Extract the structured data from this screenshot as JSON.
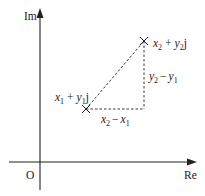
{
  "diagram": {
    "axes": {
      "y_label": "Im",
      "x_label": "Re",
      "origin_label": "O"
    },
    "points": [
      {
        "name": "z1",
        "label_x": "x",
        "label_x_sub": "1",
        "plus": "+",
        "label_y": "y",
        "label_y_sub": "1",
        "unit": "j"
      },
      {
        "name": "z2",
        "label_x": "x",
        "label_x_sub": "2",
        "plus": "+",
        "label_y": "y",
        "label_y_sub": "2",
        "unit": "j"
      }
    ],
    "segments": {
      "horizontal": {
        "a": "x",
        "a_sub": "2",
        "op": "−",
        "b": "x",
        "b_sub": "1"
      },
      "vertical": {
        "a": "y",
        "a_sub": "2",
        "op": "−",
        "b": "y",
        "b_sub": "1"
      }
    },
    "colors": {
      "line": "#222222",
      "background": "#ffffff"
    }
  }
}
